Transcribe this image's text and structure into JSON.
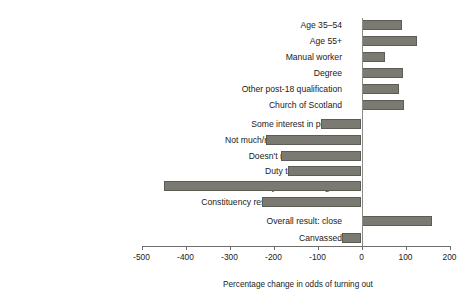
{
  "chart_data": {
    "type": "bar",
    "orientation": "horizontal",
    "title": "",
    "xlabel": "Percentage change in odds of turning out",
    "ylabel": "",
    "xlim": [
      -500,
      200
    ],
    "xticks": [
      -500,
      -400,
      -300,
      -200,
      -100,
      0,
      100,
      200
    ],
    "xtick_labels": [
      "-500",
      "-400",
      "-300",
      "-200",
      "-100",
      "0",
      "100",
      "200"
    ],
    "grid": false,
    "legend": "none",
    "bar_color": "#7a7a72",
    "categories": [
      "Age 35–54",
      "Age 55+",
      "Manual worker",
      "Degree",
      "Other post-18 qualification",
      "Church of Scotland",
      "Some interest in politics",
      "Not much/no interest in politics",
      "Doesn't matter who wins",
      "Duty to vote: neither",
      "Duty to vote: disagree",
      "Constituency result: other/don't know",
      "Overall result: close",
      "Canvassed"
    ],
    "values": [
      93,
      127,
      53,
      95,
      86,
      96,
      -93,
      -218,
      -182,
      -168,
      -448,
      -227,
      161,
      -45
    ]
  }
}
